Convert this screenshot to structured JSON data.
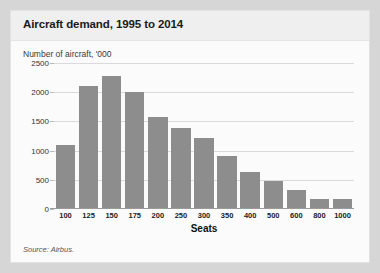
{
  "card": {
    "title": "Aircraft demand, 1995 to 2014",
    "axis_note": "Number of aircraft, '000",
    "source": "Source: Airbus."
  },
  "colors": {
    "page_background": "#d6d6d6",
    "card_background": "#fbfbfb",
    "title_band": "#efefef",
    "bar": "#8d8d8d",
    "gridline": "#dadada",
    "axis": "#9a9a9a"
  },
  "chart_data": {
    "type": "bar",
    "title": "Aircraft demand, 1995 to 2014",
    "subtitle": "Number of aircraft, '000",
    "xlabel": "Seats",
    "ylabel": "",
    "categories": [
      "100",
      "125",
      "150",
      "175",
      "200",
      "250",
      "300",
      "350",
      "400",
      "500",
      "600",
      "800",
      "1000"
    ],
    "values": [
      1090,
      2110,
      2280,
      2000,
      1580,
      1390,
      1220,
      910,
      630,
      480,
      330,
      180,
      180
    ],
    "ylim": [
      0,
      2500
    ],
    "yticks": [
      0,
      500,
      1000,
      1500,
      2000,
      2500
    ],
    "ytick_labels": [
      "0",
      "500",
      "1000",
      "1500",
      "2000",
      "2500"
    ],
    "grid": true,
    "legend": "none",
    "source": "Source: Airbus."
  }
}
